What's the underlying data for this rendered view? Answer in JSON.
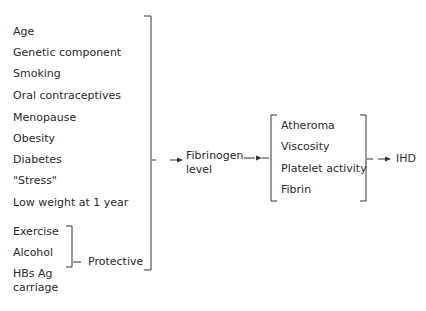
{
  "risk_factors": [
    "Age",
    "Genetic component",
    "Smoking",
    "Oral contraceptives",
    "Menopause",
    "Obesity",
    "Diabetes",
    "\"Stress\"",
    "Low weight at 1 year"
  ],
  "protective_factors": [
    "Exercise",
    "Alcohol",
    "HBs Ag",
    "carriage"
  ],
  "protective_label": "Protective",
  "intermediate": {
    "line1": "Fibrinogen",
    "line2": "level"
  },
  "mechanisms": [
    "Atheroma",
    "Viscosity",
    "Platelet activity",
    "Fibrin"
  ],
  "outcome": "IHD"
}
